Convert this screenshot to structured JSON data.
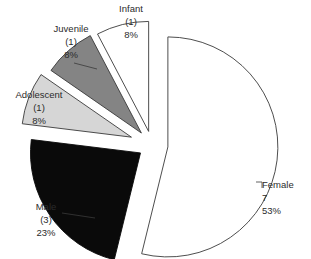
{
  "chart_data": {
    "type": "pie",
    "title": "",
    "subtitle": "",
    "xlabel": "",
    "ylabel": "",
    "legend_position": "none",
    "grid": false,
    "total": 13,
    "categories": [
      "Female",
      "Male",
      "Adolescent",
      "Juvenile",
      "Infant"
    ],
    "values": [
      7,
      3,
      1,
      1,
      1
    ],
    "percentages": [
      53,
      23,
      8,
      8,
      8
    ],
    "slices": [
      {
        "label": "Female",
        "count": "7",
        "count_display": "7",
        "percent": "53%",
        "value": 7,
        "percent_value": 53,
        "fill": "#ffffff",
        "stroke": "#3a3a3a",
        "exploded": true,
        "start_angle": 0,
        "end_angle": 193.8
      },
      {
        "label": "Male",
        "count": "(3)",
        "count_display": "(3)",
        "percent": "23%",
        "value": 3,
        "percent_value": 23,
        "fill": "#0a0a0a",
        "stroke": "#0a0a0a",
        "exploded": true,
        "start_angle": 193.8,
        "end_angle": 277.0
      },
      {
        "label": "Adolescent",
        "count": "(1)",
        "count_display": "(1)",
        "percent": "8%",
        "value": 1,
        "percent_value": 8,
        "fill": "#d6d6d6",
        "stroke": "#3a3a3a",
        "exploded": true,
        "start_angle": 277.0,
        "end_angle": 304.7
      },
      {
        "label": "Juvenile",
        "count": "(1)",
        "count_display": "(1)",
        "percent": "8%",
        "value": 1,
        "percent_value": 8,
        "fill": "#848484",
        "stroke": "#3a3a3a",
        "exploded": true,
        "start_angle": 304.7,
        "end_angle": 332.3
      },
      {
        "label": "Infant",
        "count": "(1)",
        "count_display": "(1)",
        "percent": "8%",
        "value": 1,
        "percent_value": 8,
        "fill": "#ffffff",
        "stroke": "#3a3a3a",
        "exploded": true,
        "start_angle": 332.3,
        "end_angle": 360
      }
    ]
  },
  "labels": {
    "infant": {
      "name": "Infant",
      "count": "(1)",
      "percent": "8%"
    },
    "juvenile": {
      "name": "Juvenile",
      "count": "(1)",
      "percent": "8%"
    },
    "adolescent": {
      "name": "Adolescent",
      "count": "(1)",
      "percent": "8%"
    },
    "male": {
      "name": "Male",
      "count": "(3)",
      "percent": "23%"
    },
    "female": {
      "name": "Female",
      "count": "7",
      "percent": "53%"
    }
  },
  "colors": {
    "background": "#ffffff",
    "text": "#2b2b2b",
    "outline": "#3a3a3a",
    "female_fill": "#ffffff",
    "male_fill": "#0a0a0a",
    "adolescent_fill": "#d6d6d6",
    "juvenile_fill": "#848484",
    "infant_fill": "#ffffff"
  }
}
